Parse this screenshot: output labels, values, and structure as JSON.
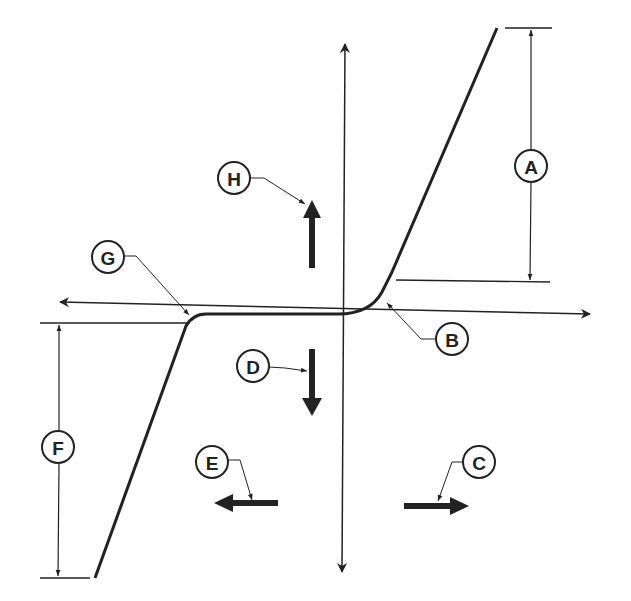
{
  "diagram": {
    "type": "hysteresis-style transfer curve with labeled callouts",
    "colors": {
      "ink": "#222222",
      "background": "#ffffff"
    },
    "axes": {
      "horizontal": "bidirectional-arrow",
      "vertical": "bidirectional-arrow"
    },
    "callouts": [
      {
        "id": "A",
        "label": "A",
        "meaning": "upper saturation span (dimension)"
      },
      {
        "id": "B",
        "label": "B",
        "meaning": "upper knee of curve"
      },
      {
        "id": "C",
        "label": "C",
        "meaning": "rightward arrow"
      },
      {
        "id": "D",
        "label": "D",
        "meaning": "downward arrow"
      },
      {
        "id": "E",
        "label": "E",
        "meaning": "leftward arrow"
      },
      {
        "id": "F",
        "label": "F",
        "meaning": "lower saturation span (dimension)"
      },
      {
        "id": "G",
        "label": "G",
        "meaning": "lower knee of curve"
      },
      {
        "id": "H",
        "label": "H",
        "meaning": "upward arrow"
      }
    ]
  }
}
